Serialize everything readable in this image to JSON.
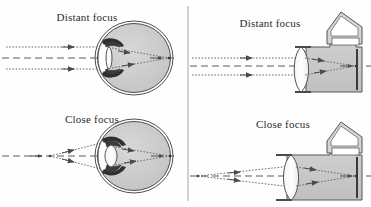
{
  "figure": {
    "kind": "optics-diagram",
    "background_color": "#fefefe",
    "ink_color": "#3a3a3a",
    "fill_gray": "#c9c9c9",
    "dark_gray": "#5c5c5c",
    "divider": {
      "name": "vertical-divider",
      "x": 188,
      "y1": 6,
      "y2": 201,
      "color": "#9a9a9a"
    }
  },
  "panels": [
    {
      "id": "eye-distant",
      "label": "Distant focus",
      "subject": "eye",
      "label_x": 87,
      "label_y": 21,
      "axis_y": 58,
      "lens_shape": "flattened",
      "rays": "parallel"
    },
    {
      "id": "camera-distant",
      "label": "Distant focus",
      "subject": "camera",
      "label_x": 270,
      "label_y": 27,
      "axis_y": 66,
      "lens_position": "retracted",
      "rays": "parallel"
    },
    {
      "id": "eye-close",
      "label": "Close focus",
      "subject": "eye",
      "label_x": 92,
      "label_y": 123,
      "axis_y": 156,
      "lens_shape": "rounded",
      "rays": "diverging"
    },
    {
      "id": "camera-close",
      "label": "Close focus",
      "subject": "camera",
      "label_x": 283,
      "label_y": 128,
      "axis_y": 176,
      "lens_position": "extended",
      "rays": "diverging"
    }
  ],
  "parts": {
    "eye": [
      "sclera",
      "cornea",
      "iris",
      "lens",
      "vitreous-body",
      "retina",
      "focal-point"
    ],
    "camera": [
      "pentaprism",
      "body",
      "lens",
      "film-plane",
      "focal-point"
    ]
  }
}
